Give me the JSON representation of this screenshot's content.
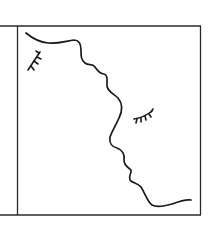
{
  "illustration": {
    "subject": "two faces in profile line art",
    "colors": {
      "background": "#ffffff",
      "frame": "#2a2a2a",
      "ink": "#1a1a1a"
    },
    "frame": {
      "left": 0,
      "top": 26,
      "right": 200,
      "bottom": 215,
      "divider_x": 17
    },
    "elements": [
      {
        "name": "profile-line",
        "description": "continuous wavy line forming two facing profiles (forehead, nose, lips, chin)"
      },
      {
        "name": "left-closed-eye",
        "description": "closed eye with lashes, upper left"
      },
      {
        "name": "right-closed-eye",
        "description": "closed eye with lashes, center right"
      }
    ]
  }
}
